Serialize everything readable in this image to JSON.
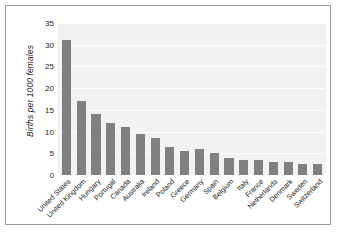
{
  "chart_data": {
    "type": "bar",
    "title": "",
    "subtitle": "",
    "xlabel": "",
    "ylabel": "Births per 1000 females",
    "ylim": [
      0,
      35
    ],
    "yticks": [
      0,
      5,
      10,
      15,
      20,
      25,
      30,
      35
    ],
    "ytick_labels": [
      "0",
      "5",
      "10",
      "15",
      "20",
      "25",
      "30",
      "35"
    ],
    "grid": true,
    "grid_axis": "y",
    "legend": false,
    "legend_position": "none",
    "bar_color": "#808080",
    "plot_background": "#f2f2f2",
    "gridline_color": "#ffffff",
    "figure_background": "#ffffff",
    "frame_color": "#9a9a9a",
    "xtick_rotation": 45,
    "categories": [
      "United States",
      "United Kingdom",
      "Hungary",
      "Portugal",
      "Canada",
      "Australia",
      "Ireland",
      "Poland",
      "Greece",
      "Germany",
      "Spain",
      "Belgium",
      "Italy",
      "France",
      "Netherlands",
      "Denmark",
      "Sweden",
      "Switzerland"
    ],
    "values": [
      31,
      17,
      14,
      12,
      11,
      9.5,
      8.5,
      6.5,
      5.5,
      6,
      5,
      4,
      3.5,
      3.5,
      3,
      3,
      2.5,
      2.5
    ]
  }
}
